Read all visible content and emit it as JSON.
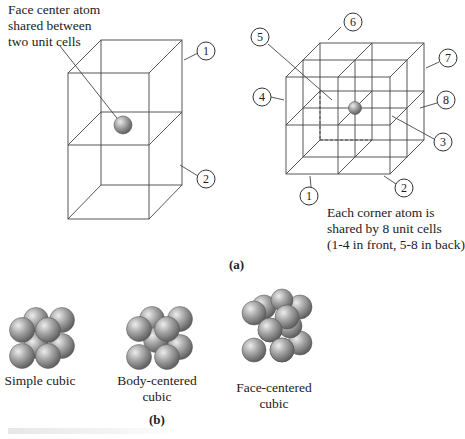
{
  "panel_a": {
    "label": "(a)",
    "left_figure": {
      "annotation": [
        "Face center atom",
        "shared between",
        "two unit cells"
      ],
      "cell_labels": [
        "1",
        "2"
      ]
    },
    "right_figure": {
      "cell_labels": [
        "1",
        "2",
        "3",
        "4",
        "5",
        "6",
        "7",
        "8"
      ],
      "annotation": [
        "Each corner atom is",
        "shared by 8 unit cells",
        "(1-4 in front, 5-8 in back)"
      ]
    }
  },
  "panel_b": {
    "label": "(b)",
    "structures": [
      {
        "name": "Simple cubic",
        "caption": [
          "Simple cubic"
        ]
      },
      {
        "name": "Body-centered cubic",
        "caption": [
          "Body-centered",
          "cubic"
        ]
      },
      {
        "name": "Face-centered cubic",
        "caption": [
          "Face-centered",
          "cubic"
        ]
      }
    ]
  },
  "colors": {
    "line": "#333333",
    "atom": "#9a9a9a",
    "atom_highlight": "#e6e6e6"
  }
}
